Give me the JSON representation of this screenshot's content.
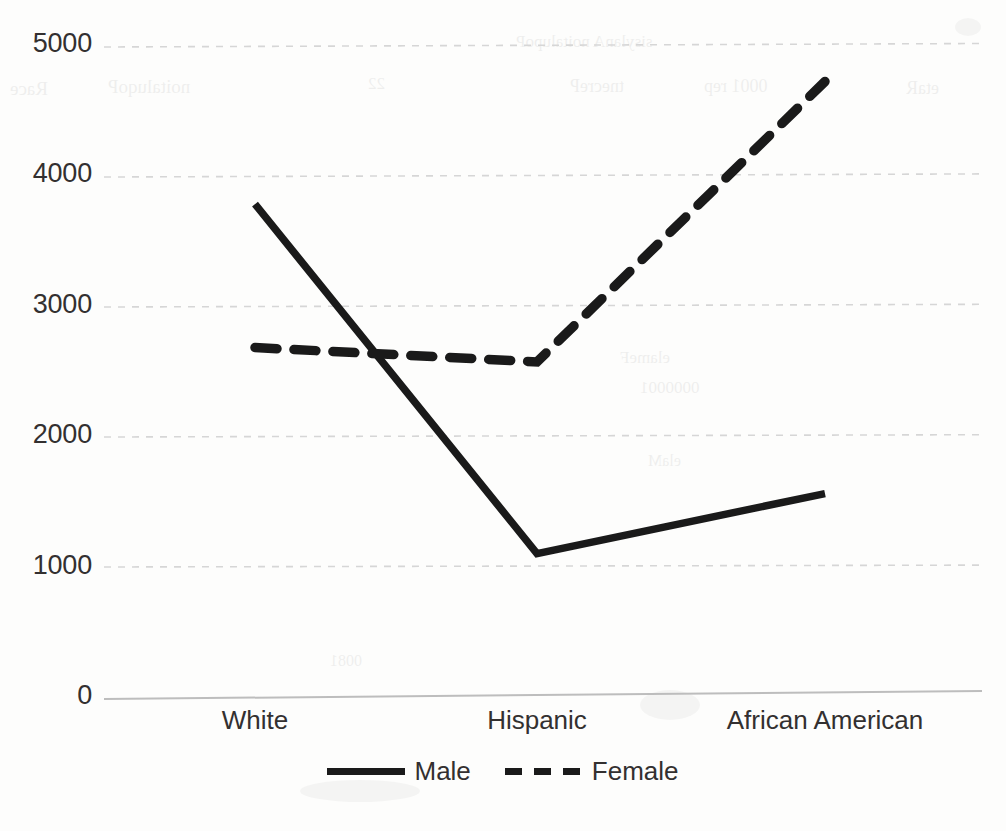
{
  "chart_data": {
    "type": "line",
    "title": "",
    "subtitle": "",
    "xlabel": "",
    "ylabel": "",
    "categories": [
      "White",
      "Hispanic",
      "African American"
    ],
    "series": [
      {
        "name": "Male",
        "values": [
          3780,
          1100,
          1560
        ],
        "style": "solid",
        "color": "#1a1a1a"
      },
      {
        "name": "Female",
        "values": [
          2680,
          2570,
          4720
        ],
        "style": "dashed",
        "color": "#1a1a1a"
      }
    ],
    "ylim": [
      0,
      5000
    ],
    "ytick_labels": [
      "0",
      "1000",
      "2000",
      "3000",
      "4000",
      "5000"
    ],
    "ytick_values": [
      0,
      1000,
      2000,
      3000,
      4000,
      5000
    ],
    "grid": true,
    "grid_axis": "y",
    "grid_color": "#d9d9d9",
    "legend_position": "bottom",
    "legend": [
      "Male",
      "Female"
    ],
    "annotations": []
  },
  "axes": {
    "y": {
      "ticks": [
        {
          "label": "5000",
          "value": 5000
        },
        {
          "label": "4000",
          "value": 4000
        },
        {
          "label": "3000",
          "value": 3000
        },
        {
          "label": "2000",
          "value": 2000
        },
        {
          "label": "1000",
          "value": 1000
        },
        {
          "label": "0",
          "value": 0
        }
      ]
    },
    "x": {
      "ticks": [
        {
          "label": "White"
        },
        {
          "label": "Hispanic"
        },
        {
          "label": "African American"
        }
      ]
    }
  },
  "legend": {
    "items": [
      {
        "label": "Male",
        "style": "solid"
      },
      {
        "label": "Female",
        "style": "dashed"
      }
    ]
  },
  "artifacts": {
    "showthrough": [
      {
        "text": "Race",
        "x": 10,
        "y": 78,
        "size": 19
      },
      {
        "text": "noitaluqoP",
        "x": 108,
        "y": 76,
        "size": 19
      },
      {
        "text": "22",
        "x": 368,
        "y": 74,
        "size": 17
      },
      {
        "text": "tnecreP",
        "x": 570,
        "y": 76,
        "size": 18
      },
      {
        "text": "0001 rep",
        "x": 704,
        "y": 76,
        "size": 18
      },
      {
        "text": "etaR",
        "x": 906,
        "y": 78,
        "size": 18
      },
      {
        "text": "sisylanA noitalupoP",
        "x": 516,
        "y": 36,
        "size": 17
      }
    ]
  }
}
